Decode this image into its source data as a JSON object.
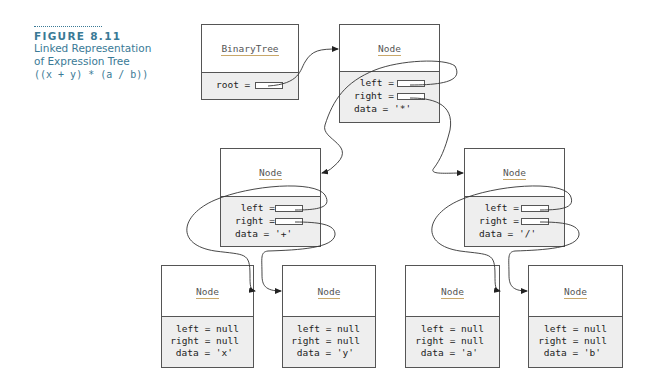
{
  "caption": {
    "figure_label": "FIGURE 8.11",
    "title_line1": "Linked Representation",
    "title_line2": "of Expression Tree",
    "expression": "((x + y) * (a / b))"
  },
  "binary_tree": {
    "class_name": "BinaryTree",
    "field_root": "root ="
  },
  "nodes": {
    "root": {
      "class_name": "Node",
      "left": "left =",
      "right": "right =",
      "data": "data = '*'"
    },
    "plus": {
      "class_name": "Node",
      "left": "left =",
      "right": "right =",
      "data": "data = '+'"
    },
    "div": {
      "class_name": "Node",
      "left": "left =",
      "right": "right =",
      "data": "data = '/'"
    },
    "x": {
      "class_name": "Node",
      "left": "left = null",
      "right": "right = null",
      "data": "data = 'x'"
    },
    "y": {
      "class_name": "Node",
      "left": "left = null",
      "right": "right = null",
      "data": "data = 'y'"
    },
    "a": {
      "class_name": "Node",
      "left": "left = null",
      "right": "right = null",
      "data": "data = 'a'"
    },
    "b": {
      "class_name": "Node",
      "left": "left = null",
      "right": "right = null",
      "data": "data = 'b'"
    }
  },
  "colors": {
    "caption": "#3a7a96",
    "box_border": "#555555",
    "field_background": "#eeeeee",
    "class_underline": "#c9a86a"
  }
}
